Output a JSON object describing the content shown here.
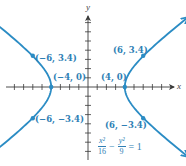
{
  "chart_data": {
    "type": "line",
    "title": "",
    "xlabel": "x",
    "ylabel": "y",
    "equation": {
      "x_term_num": "x²",
      "x_term_den": "16",
      "minus": "−",
      "y_term_num": "y²",
      "y_term_den": "9",
      "equals": "= 1",
      "text": "x²/16 − y²/9 = 1"
    },
    "curve": "hyperbola",
    "a": 4,
    "b": 3,
    "xlim": [
      -9,
      9
    ],
    "ylim": [
      -8,
      9
    ],
    "grid": false,
    "x_ticks_each_side": 8,
    "y_ticks_each_side": 7,
    "labeled_points": [
      {
        "x": -6,
        "y": 3.4,
        "label": "(−6, 3.4)"
      },
      {
        "x": 6,
        "y": 3.4,
        "label": "(6, 3.4)"
      },
      {
        "x": -4,
        "y": 0,
        "label": "(−4, 0)"
      },
      {
        "x": 4,
        "y": 0,
        "label": "(4, 0)"
      },
      {
        "x": -6,
        "y": -3.4,
        "label": "(−6, −3.4)"
      },
      {
        "x": 6,
        "y": -3.4,
        "label": "(6, −3.4)"
      }
    ],
    "series": [
      {
        "name": "right branch",
        "x_range": [
          4,
          8.2
        ]
      },
      {
        "name": "left branch",
        "x_range": [
          -8.2,
          -4
        ]
      }
    ],
    "colors": {
      "curve": "#2b8cc4",
      "axis": "#3a3a3a",
      "labels": "#2f7fb5"
    }
  }
}
